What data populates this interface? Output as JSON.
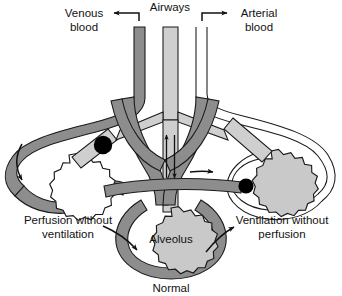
{
  "figure": {
    "title_label": "Airways"
  },
  "labels": {
    "airways": "Airways",
    "venous_line1": "Venous",
    "venous_line2": "blood",
    "arterial_line1": "Arterial",
    "arterial_line2": "blood",
    "left_unit_line1": "Perfusion without",
    "left_unit_line2": "ventilation",
    "right_unit_line1": "Ventilation without",
    "right_unit_line2": "perfusion",
    "center_alveolus": "Alveolus",
    "center_unit": "Normal"
  },
  "colors": {
    "vessel_dark": "#8d8d8d",
    "vessel_dark_stroke": "#1a1a1a",
    "airway_light": "#cfcfcf",
    "alveolus_light": "#c9c9c9",
    "alveolus_white": "#ffffff",
    "plug_black": "#000000",
    "outline": "#1a1a1a",
    "text": "#111111",
    "background": "#ffffff"
  },
  "elements": {
    "central_airway_arrow_up": "inspiration-flow-arrow",
    "central_airway_arrow_down": "expiration-flow-arrow",
    "plug_left": "airway-obstruction-plug",
    "plug_right": "vascular-obstruction-plug",
    "arrow_left_outer": "venous-flow-arrow-left",
    "arrow_bottom_left": "blood-flow-arrow-bottom-left",
    "arrow_bottom_right": "blood-flow-arrow-bottom-right",
    "arrow_mid_right": "shunt-flow-arrow-right"
  }
}
